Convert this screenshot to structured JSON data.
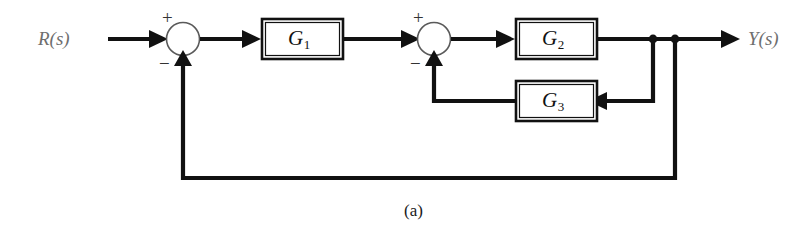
{
  "figure": {
    "caption": "(a)",
    "type": "control-system-block-diagram",
    "background_color": "#ffffff",
    "line_color": "#111111",
    "label_color": "#6e6e6e"
  },
  "signals": {
    "input_label": "R(s)",
    "output_label": "Y(s)"
  },
  "blocks": [
    {
      "id": "G1",
      "label": "G",
      "subscript": "1"
    },
    {
      "id": "G2",
      "label": "G",
      "subscript": "2"
    },
    {
      "id": "G3",
      "label": "G",
      "subscript": "3"
    }
  ],
  "summing_junctions": [
    {
      "id": "sum1",
      "positive_sign": "+",
      "negative_sign": "−"
    },
    {
      "id": "sum2",
      "positive_sign": "+",
      "negative_sign": "−"
    }
  ]
}
